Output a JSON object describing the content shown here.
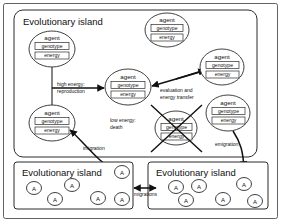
{
  "figure": {
    "kind": "diagram",
    "background": "#ffffff",
    "line_color": "#2b2b2b"
  },
  "outer_frame": {
    "label": "outer-border"
  },
  "islands": [
    {
      "id": "main-island",
      "title": "Evolutionary island"
    },
    {
      "id": "bottom-left-island",
      "title": "Evolutionary island"
    },
    {
      "id": "bottom-right-island",
      "title": "Evolutionary island"
    }
  ],
  "agent_node": {
    "title": "agent",
    "slots": [
      "genotype",
      "energy"
    ]
  },
  "agents": [
    {
      "id": "agent-top-left",
      "title": "agent",
      "genotype": "genotype",
      "energy": "energy"
    },
    {
      "id": "agent-top-center",
      "title": "agent",
      "genotype": "genotype",
      "energy": "energy"
    },
    {
      "id": "agent-center",
      "title": "agent",
      "genotype": "genotype",
      "energy": "energy"
    },
    {
      "id": "agent-right-upper",
      "title": "agent",
      "genotype": "genotype",
      "energy": "energy"
    },
    {
      "id": "agent-right-lower",
      "title": "agent",
      "genotype": "genotype",
      "energy": "energy"
    },
    {
      "id": "agent-left-lower",
      "title": "agent",
      "genotype": "genotype",
      "energy": "energy"
    },
    {
      "id": "agent-dead",
      "title": "agent",
      "genotype": "genotype",
      "energy": "energy"
    }
  ],
  "edge_labels": {
    "reproduction_line1": "high energy:",
    "reproduction_line2": "reproduction",
    "evaluation_line1": "evaluation and",
    "evaluation_line2": "energy transfer",
    "death_line1": "low energy:",
    "death_line2": "death",
    "immigration": "imigration",
    "emigration": "emigration",
    "migrations": "migrations"
  },
  "mini_agents": {
    "glyph": "A",
    "bottom_left_count": 6,
    "bottom_right_count": 7
  }
}
